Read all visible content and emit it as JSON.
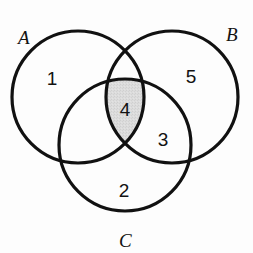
{
  "figure": {
    "type": "venn-diagram",
    "background_color": "#fdfdfd",
    "stroke_color": "#111111",
    "text_color": "#121212",
    "shaded_region_color": "#d9d9d9",
    "shaded_region_label": "4",
    "shaded_region_name": "A-intersect-B-intersect-C"
  },
  "sets": {
    "a": {
      "label": "A",
      "cx": 78,
      "cy": 97,
      "r": 66,
      "label_x": 18,
      "label_y": 44
    },
    "b": {
      "label": "B",
      "cx": 172,
      "cy": 97,
      "r": 66,
      "label_x": 226,
      "label_y": 41
    },
    "c": {
      "label": "C",
      "cx": 125,
      "cy": 145,
      "r": 66,
      "label_x": 119,
      "label_y": 247
    }
  },
  "regions": [
    {
      "name": "a-only",
      "value": "1",
      "x": 52,
      "y": 80,
      "shaded": false
    },
    {
      "name": "b-only",
      "value": "5",
      "x": 191,
      "y": 78,
      "shaded": false
    },
    {
      "name": "c-only",
      "value": "2",
      "x": 124,
      "y": 192,
      "shaded": false
    },
    {
      "name": "b-and-c",
      "value": "3",
      "x": 163,
      "y": 141,
      "shaded": false
    },
    {
      "name": "a-b-and-c",
      "value": "4",
      "x": 125,
      "y": 111,
      "shaded": true
    }
  ],
  "chart_data": {
    "type": "venn",
    "title": "",
    "sets": [
      "A",
      "B",
      "C"
    ],
    "region_labels": {
      "A only": "1",
      "B only": "5",
      "C only": "2",
      "B and C only": "3",
      "A and B and C": "4"
    },
    "highlighted_regions": [
      "A and B and C"
    ],
    "values": [
      1,
      5,
      2,
      3,
      4
    ],
    "categories": [
      "A only",
      "B only",
      "C only",
      "B and C only",
      "A and B and C"
    ]
  }
}
